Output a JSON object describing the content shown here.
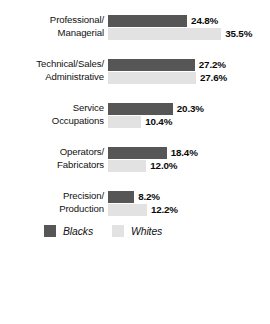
{
  "chart_data": {
    "type": "bar",
    "orientation": "horizontal",
    "title": "",
    "subtitle": "",
    "xlabel": "",
    "ylabel": "",
    "grid": false,
    "legend_position": "bottom-left",
    "xlim": [
      0,
      35.5
    ],
    "value_suffix": "%",
    "categories": [
      "Professional/ Managerial",
      "Technical/Sales/ Administrative",
      "Service Occupations",
      "Operators/ Fabricators",
      "Precision/ Production"
    ],
    "category_lines": [
      [
        "Professional/",
        "Managerial"
      ],
      [
        "Technical/Sales/",
        "Administrative"
      ],
      [
        "Service",
        "Occupations"
      ],
      [
        "Operators/",
        "Fabricators"
      ],
      [
        "Precision/",
        "Production"
      ]
    ],
    "series": [
      {
        "name": "Blacks",
        "color": "#565656",
        "values": [
          24.8,
          27.2,
          20.3,
          18.4,
          8.2
        ],
        "labels": [
          "24.8%",
          "27.2%",
          "20.3%",
          "18.4%",
          "8.2%"
        ]
      },
      {
        "name": "Whites",
        "color": "#e2e2e2",
        "values": [
          35.5,
          27.6,
          10.4,
          12.0,
          12.2
        ],
        "labels": [
          "35.5%",
          "27.6%",
          "10.4%",
          "12.0%",
          "12.2%"
        ]
      }
    ]
  },
  "legend": {
    "entries": [
      {
        "label": "Blacks",
        "color": "#565656"
      },
      {
        "label": "Whites",
        "color": "#e2e2e2"
      }
    ]
  },
  "layout": {
    "bar_origin_x": 108,
    "px_per_percent": 3.19,
    "group_tops": [
      14,
      58,
      102,
      146,
      190
    ],
    "bar_height": 12
  },
  "colors": {
    "background": "#ffffff",
    "blacks_series": "#565656",
    "whites_series": "#e2e2e2",
    "text": "#111111"
  }
}
